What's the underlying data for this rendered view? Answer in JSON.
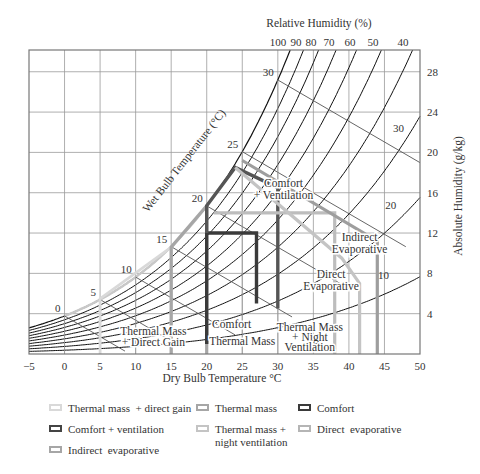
{
  "chart_data": {
    "type": "line",
    "xlabel": "Dry Bulb Temperature °C",
    "ylabel_right": "Absolute Humidity (g/kg)",
    "top_label": "Relative Humidity (%)",
    "diag_label": "Wet Bulb Temperature (°C)",
    "xlim": [
      -5,
      50
    ],
    "ylim": [
      0,
      30
    ],
    "x_ticks": [
      -5,
      0,
      5,
      10,
      15,
      20,
      25,
      30,
      35,
      40,
      45,
      50
    ],
    "y_ticks": [
      4,
      8,
      12,
      16,
      20,
      24,
      28
    ],
    "rh_curves": [
      100,
      90,
      80,
      70,
      60,
      50,
      40,
      30,
      20,
      10
    ],
    "rh_top_labels": [
      "100",
      "90",
      "80",
      "70",
      "60",
      "50",
      "40"
    ],
    "rh_inner_labels": [
      {
        "text": "30",
        "T": 48.6,
        "w": 22.0
      },
      {
        "text": "20",
        "T": 47.5,
        "w": 14.4
      },
      {
        "text": "10",
        "T": 46.5,
        "w": 7.4
      }
    ],
    "wet_bulb_labels": [
      {
        "text": "0",
        "T": 0
      },
      {
        "text": "5",
        "T": 5
      },
      {
        "text": "10",
        "T": 10
      },
      {
        "text": "15",
        "T": 15
      },
      {
        "text": "20",
        "T": 20
      },
      {
        "text": "25",
        "T": 25
      },
      {
        "text": "30",
        "T": 30
      }
    ],
    "wet_bulb_lines": [
      {
        "T_sat": 0,
        "T_end": 8.5
      },
      {
        "T_sat": 5,
        "T_end": 16.5
      },
      {
        "T_sat": 10,
        "T_end": 24
      },
      {
        "T_sat": 15,
        "T_end": 32
      },
      {
        "T_sat": 20,
        "T_end": 40
      },
      {
        "T_sat": 25,
        "T_end": 48
      },
      {
        "T_sat": 30,
        "T_end": 50
      }
    ],
    "zones": [
      {
        "name": "Thermal mass + direct gain",
        "color": "#d9d9d9",
        "width": 1.6,
        "points": [
          [
            5,
            0
          ],
          [
            5,
            5.5
          ],
          [
            15,
            10.6
          ],
          [
            15,
            0
          ]
        ]
      },
      {
        "name": "Thermal mass",
        "color": "#a6a6a6",
        "width": 2,
        "points": [
          [
            15,
            0
          ],
          [
            15,
            10.6
          ],
          [
            20,
            14.7
          ],
          [
            20,
            0
          ]
        ]
      },
      {
        "name": "Comfort",
        "color": "#3a3a3a",
        "width": 2.2,
        "points": [
          [
            20,
            1
          ],
          [
            20,
            12
          ],
          [
            27,
            12
          ],
          [
            27,
            5
          ]
        ]
      },
      {
        "name": "Comfort + ventilation",
        "color": "#555555",
        "width": 2.2,
        "points": [
          [
            20,
            12
          ],
          [
            20,
            14.7
          ],
          [
            24,
            18.5
          ],
          [
            30,
            16.5
          ],
          [
            30,
            4.5
          ]
        ]
      },
      {
        "name": "Thermal mass + night ventilation",
        "color": "#bdbdbd",
        "width": 2,
        "points": [
          [
            21,
            14
          ],
          [
            38,
            14
          ],
          [
            38,
            0
          ]
        ]
      },
      {
        "name": "Direct evaporative",
        "color": "#c4c4c4",
        "width": 2,
        "points": [
          [
            24,
            18.5
          ],
          [
            39,
            9.5
          ],
          [
            41.5,
            7
          ],
          [
            41.5,
            0
          ]
        ]
      },
      {
        "name": "Indirect evaporative",
        "color": "#9e9e9e",
        "width": 2,
        "points": [
          [
            25,
            19.2
          ],
          [
            44,
            11.2
          ],
          [
            44,
            0
          ]
        ]
      }
    ],
    "annotations": [
      {
        "text": "Comfort",
        "T": 30.8,
        "w": 16.6
      },
      {
        "text": "+ Ventilation",
        "T": 30.8,
        "w": 15.4
      },
      {
        "text": "Indirect",
        "T": 41.5,
        "w": 11.2
      },
      {
        "text": "Evaporative",
        "T": 41.5,
        "w": 10.0
      },
      {
        "text": "Direct",
        "T": 37.5,
        "w": 7.5
      },
      {
        "text": "Evaporative",
        "T": 37.5,
        "w": 6.3
      },
      {
        "text": "Comfort",
        "T": 23.5,
        "w": 2.6
      },
      {
        "text": "Thermal Mass",
        "T": 25.0,
        "w": 0.9
      },
      {
        "text": "Thermal Mass",
        "T": 12.5,
        "w": 1.9
      },
      {
        "text": "+ Direct Gain",
        "T": 12.5,
        "w": 0.8
      },
      {
        "text": "Thermal Mass",
        "T": 34.5,
        "w": 2.3
      },
      {
        "text": "+ Night",
        "T": 34.5,
        "w": 1.3
      },
      {
        "text": "Ventilation",
        "T": 34.5,
        "w": 0.3
      }
    ],
    "grid": true,
    "legend_position": "bottom"
  },
  "legend": [
    {
      "label": "Thermal mass  + direct gain",
      "color": "#d9d9d9",
      "x": 49,
      "y": 402
    },
    {
      "label": "Thermal mass",
      "color": "#a6a6a6",
      "x": 196,
      "y": 402
    },
    {
      "label": "Comfort",
      "color": "#3a3a3a",
      "x": 298,
      "y": 402
    },
    {
      "label": "Comfort + ventilation",
      "color": "#444444",
      "x": 49,
      "y": 423
    },
    {
      "label": "Thermal mass +\nnight ventilation",
      "color": "#c4c4c4",
      "x": 196,
      "y": 423
    },
    {
      "label": "Direct  evaporative",
      "color": "#b5b5b5",
      "x": 298,
      "y": 423
    },
    {
      "label": "Indirect  evaporative",
      "color": "#a6a6a6",
      "x": 49,
      "y": 444
    }
  ]
}
